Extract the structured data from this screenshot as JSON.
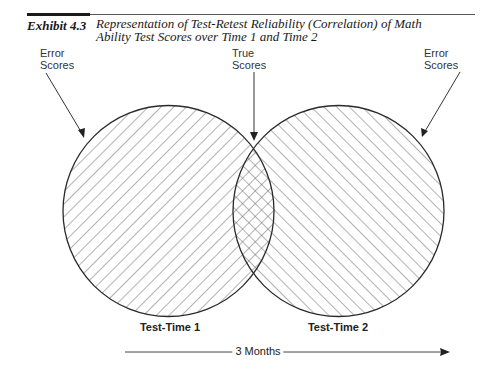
{
  "header": {
    "exhibit_number": "Exhibit 4.3",
    "title_line1": "Representation of Test-Retest Reliability (Correlation) of Math",
    "title_line2": "Ability Test Scores over Time 1 and Time 2"
  },
  "callouts": {
    "left": {
      "line1": "Error",
      "line2": "Scores"
    },
    "center": {
      "line1": "True",
      "line2": "Scores"
    },
    "right": {
      "line1": "Error",
      "line2": "Scores"
    }
  },
  "circles": [
    {
      "label": "Test-Time 1",
      "cx": 168.5,
      "cy": 211,
      "r": 105.5,
      "hatch": "backslash"
    },
    {
      "label": "Test-Time 2",
      "cx": 338.5,
      "cy": 211,
      "r": 105.5,
      "hatch": "slash"
    }
  ],
  "overlap": {
    "label": "True Scores",
    "hatch": "crosshatch"
  },
  "timeline": {
    "label": "3 Months",
    "direction": "left-to-right"
  },
  "colors": {
    "stroke": "#2a2a2a",
    "hatch": "#555555",
    "background": "#ffffff"
  }
}
